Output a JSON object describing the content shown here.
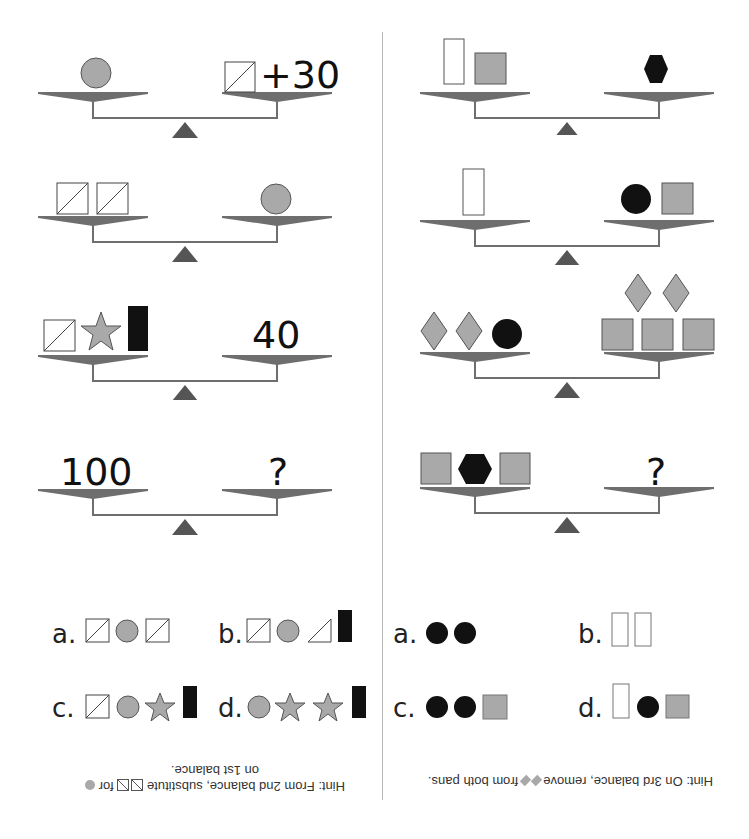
{
  "colors": {
    "gray_fill": "#a9a9a9",
    "black_fill": "#111111",
    "outline": "#444444",
    "beam": "#6e6e6e",
    "fulcrum": "#5a5a5a",
    "divider": "#b5b5b5"
  },
  "left_puzzle": {
    "balances": [
      {
        "left": [
          "circle-gray"
        ],
        "right": [
          "square-slash",
          "text:+30"
        ]
      },
      {
        "left": [
          "square-slash",
          "square-slash"
        ],
        "right": [
          "circle-gray"
        ]
      },
      {
        "left": [
          "square-slash",
          "star-gray",
          "rect-black"
        ],
        "right": [
          "text:40"
        ]
      },
      {
        "left": [
          "text:100"
        ],
        "right": [
          "text:?"
        ]
      }
    ],
    "texts": {
      "b1_right": "+30",
      "b3_right": "40",
      "b4_left": "100",
      "b4_right": "?"
    },
    "choices": [
      {
        "label": "a.",
        "items": [
          "square-slash",
          "circle-gray",
          "square-slash"
        ]
      },
      {
        "label": "b.",
        "items": [
          "square-slash",
          "circle-gray",
          "triangle-half",
          "rect-black"
        ]
      },
      {
        "label": "c.",
        "items": [
          "square-slash",
          "circle-gray",
          "star-gray",
          "rect-black"
        ]
      },
      {
        "label": "d.",
        "items": [
          "circle-gray",
          "star-gray",
          "star-gray",
          "rect-black"
        ]
      }
    ],
    "hint_line1": "Hint:  From 2nd balance, substitute",
    "hint_line1_end": "for",
    "hint_line2": "on 1st balance."
  },
  "right_puzzle": {
    "balances": [
      {
        "left": [
          "rect-white",
          "square-gray"
        ],
        "right": [
          "hexagon-black"
        ]
      },
      {
        "left": [
          "rect-white"
        ],
        "right": [
          "circle-black",
          "square-gray"
        ]
      },
      {
        "left": [
          "diamond-gray",
          "diamond-gray",
          "circle-black"
        ],
        "right": [
          "square-gray",
          "square-gray",
          "square-gray",
          "diamond-gray",
          "diamond-gray"
        ]
      },
      {
        "left": [
          "square-gray",
          "hexagon-black",
          "square-gray"
        ],
        "right": [
          "text:?"
        ]
      }
    ],
    "texts": {
      "b4_right": "?"
    },
    "choices": [
      {
        "label": "a.",
        "items": [
          "circle-black",
          "circle-black"
        ]
      },
      {
        "label": "b.",
        "items": [
          "rect-white",
          "rect-white"
        ]
      },
      {
        "label": "c.",
        "items": [
          "circle-black",
          "circle-black",
          "square-gray"
        ]
      },
      {
        "label": "d.",
        "items": [
          "rect-white",
          "circle-black",
          "square-gray"
        ]
      }
    ],
    "hint_line1": "Hint:  On 3rd balance, remove",
    "hint_line1_end": "from both pans."
  }
}
